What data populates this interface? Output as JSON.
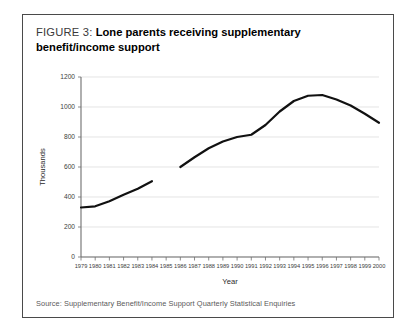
{
  "figure": {
    "label": "FIGURE 3:",
    "title": "Lone parents receiving supplementary benefit/income support",
    "source": "Source: Supplementary Benefit/Income Support Quarterly Statistical Enquiries"
  },
  "chart_data": {
    "type": "line",
    "title": "Lone parents receiving supplementary benefit/income support",
    "xlabel": "Year",
    "ylabel": "Thousands",
    "xlim": [
      1979,
      2000
    ],
    "ylim": [
      0,
      1200
    ],
    "yticks": [
      0,
      200,
      400,
      600,
      800,
      1000,
      1200
    ],
    "ytick_labels": [
      "0",
      "200",
      "400",
      "600",
      "800",
      "1000",
      "1200"
    ],
    "xticks": [
      1979,
      1980,
      1981,
      1982,
      1983,
      1984,
      1985,
      1986,
      1987,
      1988,
      1989,
      1990,
      1991,
      1992,
      1993,
      1994,
      1995,
      1996,
      1997,
      1998,
      1999,
      2000
    ],
    "xtick_labels": [
      "1979",
      "1980",
      "1981",
      "1982",
      "1983",
      "1984",
      "1985",
      "1986",
      "1987",
      "1988",
      "1989",
      "1990",
      "1991",
      "1992",
      "1993",
      "1994",
      "1995",
      "1996",
      "1997",
      "1998",
      "1999",
      "2000"
    ],
    "grid": true,
    "legend": "none",
    "line_color": "#111111",
    "series": [
      {
        "name": "Supplementary benefit (pre-1986)",
        "x": [
          1979,
          1980,
          1981,
          1982,
          1983,
          1984
        ],
        "values": [
          330,
          338,
          372,
          415,
          455,
          505
        ]
      },
      {
        "name": "Income support (1986 onwards)",
        "x": [
          1986,
          1987,
          1988,
          1989,
          1990,
          1991,
          1992,
          1993,
          1994,
          1995,
          1996,
          1997,
          1998,
          1999,
          2000
        ],
        "values": [
          600,
          665,
          725,
          770,
          800,
          815,
          880,
          970,
          1040,
          1075,
          1080,
          1050,
          1010,
          955,
          895
        ]
      }
    ]
  }
}
